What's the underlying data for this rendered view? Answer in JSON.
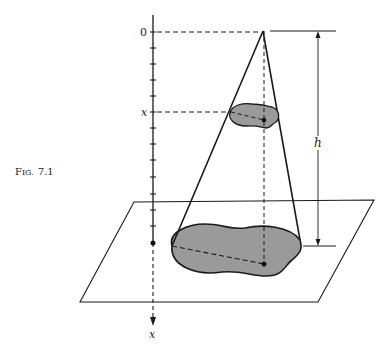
{
  "figure": {
    "caption": "Fig. 7.1",
    "caption_prefix": "F",
    "caption_smallcaps": "IG.",
    "caption_number": "7.1"
  },
  "axis": {
    "origin_label": "0",
    "level_label": "x",
    "axis_end_label": "x",
    "tick_count": 13
  },
  "dimension": {
    "height_label": "h"
  },
  "colors": {
    "ink": "#1a1a1a",
    "shade": "#9a9a9a",
    "background": "#ffffff"
  }
}
